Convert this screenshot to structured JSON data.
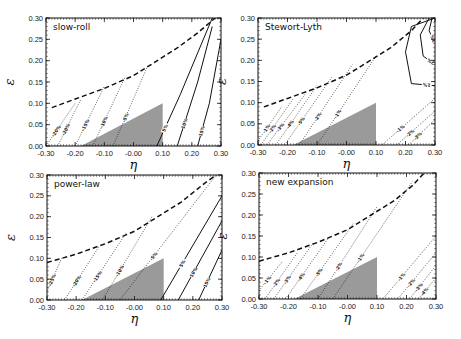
{
  "chart_data": [
    {
      "type": "line",
      "title": "slow-roll",
      "xlabel": "η",
      "ylabel": "ε",
      "xlim": [
        -0.3,
        0.3
      ],
      "ylim": [
        0.0,
        0.3
      ],
      "xticks": [
        "-0.30",
        "-0.20",
        "-0.10",
        "-0.00",
        "0.10",
        "0.20",
        "0.30"
      ],
      "yticks": [
        "0.00",
        "0.05",
        "0.10",
        "0.15",
        "0.20",
        "0.25",
        "0.30"
      ],
      "shaded_region": {
        "vertices": [
          [
            -0.18,
            0.0
          ],
          [
            0.1,
            0.0
          ],
          [
            0.1,
            0.1
          ]
        ],
        "color": "#9a9a9a"
      },
      "dashed_boundary": {
        "x": [
          -0.28,
          -0.2,
          -0.1,
          0.0,
          0.07,
          0.15,
          0.22,
          0.28
        ],
        "y": [
          0.09,
          0.11,
          0.135,
          0.165,
          0.195,
          0.23,
          0.265,
          0.3
        ]
      },
      "contours": [
        {
          "label": "-20%",
          "style": "dotted",
          "x": [
            -0.3,
            -0.2
          ],
          "y": [
            0.0,
            0.1
          ]
        },
        {
          "label": "-20%",
          "style": "dotted",
          "x": [
            -0.26,
            -0.18
          ],
          "y": [
            0.0,
            0.11
          ]
        },
        {
          "label": "-15%",
          "style": "dotted",
          "x": [
            -0.2,
            -0.1
          ],
          "y": [
            0.0,
            0.14
          ]
        },
        {
          "label": "-10%",
          "style": "dotted",
          "x": [
            -0.14,
            -0.03
          ],
          "y": [
            0.0,
            0.16
          ]
        },
        {
          "label": "-5%",
          "style": "dotted",
          "x": [
            -0.07,
            0.05
          ],
          "y": [
            0.0,
            0.19
          ]
        },
        {
          "label": "5%",
          "style": "solid",
          "x": [
            0.08,
            0.16,
            0.27
          ],
          "y": [
            0.0,
            0.12,
            0.3
          ]
        },
        {
          "label": "10%",
          "style": "solid",
          "x": [
            0.15,
            0.22,
            0.27
          ],
          "y": [
            0.0,
            0.15,
            0.28
          ]
        },
        {
          "label": "15%",
          "style": "solid",
          "x": [
            0.22,
            0.26,
            0.3
          ],
          "y": [
            0.0,
            0.1,
            0.25
          ]
        }
      ]
    },
    {
      "type": "line",
      "title": "Stewort-Lyth",
      "xlabel": "η",
      "ylabel": "ε",
      "xlim": [
        -0.3,
        0.3
      ],
      "ylim": [
        0.0,
        0.3
      ],
      "xticks": [
        "-0.30",
        "-0.20",
        "-0.10",
        "-0.00",
        "0.10",
        "0.20",
        "0.30"
      ],
      "yticks": [
        "0.00",
        "0.05",
        "0.10",
        "0.15",
        "0.20",
        "0.25",
        "0.30"
      ],
      "shaded_region": {
        "vertices": [
          [
            -0.18,
            0.0
          ],
          [
            0.1,
            0.0
          ],
          [
            0.1,
            0.1
          ]
        ],
        "color": "#9a9a9a"
      },
      "dashed_boundary": {
        "x": [
          -0.28,
          -0.2,
          -0.1,
          0.0,
          0.07,
          0.15,
          0.22,
          0.26
        ],
        "y": [
          0.09,
          0.11,
          0.135,
          0.165,
          0.195,
          0.23,
          0.27,
          0.3
        ]
      },
      "contours": [
        {
          "label": "-1%",
          "style": "dotted",
          "x": [
            -0.3,
            -0.22
          ],
          "y": [
            0.01,
            0.09
          ]
        },
        {
          "label": "-2%",
          "style": "dotted",
          "x": [
            -0.29,
            -0.18
          ],
          "y": [
            0.0,
            0.11
          ]
        },
        {
          "label": "-3%",
          "style": "dotted",
          "x": [
            -0.27,
            -0.14
          ],
          "y": [
            0.0,
            0.12
          ]
        },
        {
          "label": "-4%",
          "style": "dotted",
          "x": [
            -0.24,
            -0.1
          ],
          "y": [
            0.0,
            0.14
          ]
        },
        {
          "label": "-5%",
          "style": "dotted",
          "x": [
            -0.21,
            -0.05
          ],
          "y": [
            0.0,
            0.16
          ]
        },
        {
          "label": "-2%",
          "style": "dotted",
          "x": [
            -0.16,
            0.02
          ],
          "y": [
            0.0,
            0.19
          ]
        },
        {
          "label": "-1%",
          "style": "dotted",
          "x": [
            -0.1,
            0.1
          ],
          "y": [
            0.0,
            0.21
          ]
        },
        {
          "label": "1%",
          "style": "solid",
          "x": [
            0.3,
            0.22,
            0.2,
            0.22,
            0.3
          ],
          "y": [
            0.14,
            0.145,
            0.22,
            0.28,
            0.3
          ]
        },
        {
          "label": "2%",
          "style": "solid",
          "x": [
            0.3,
            0.26,
            0.25,
            0.28
          ],
          "y": [
            0.19,
            0.21,
            0.26,
            0.3
          ]
        },
        {
          "label": "3%",
          "style": "solid",
          "x": [
            0.3,
            0.28,
            0.29
          ],
          "y": [
            0.24,
            0.27,
            0.3
          ]
        },
        {
          "label": "-1%",
          "style": "dotted",
          "x": [
            0.12,
            0.3
          ],
          "y": [
            0.0,
            0.11
          ]
        },
        {
          "label": "-2%",
          "style": "dotted",
          "x": [
            0.17,
            0.3
          ],
          "y": [
            0.0,
            0.08
          ]
        },
        {
          "label": "-3%",
          "style": "dotted",
          "x": [
            0.21,
            0.3
          ],
          "y": [
            0.0,
            0.06
          ]
        }
      ]
    },
    {
      "type": "line",
      "title": "power-law",
      "xlabel": "η",
      "ylabel": "ε",
      "xlim": [
        -0.3,
        0.3
      ],
      "ylim": [
        0.0,
        0.3
      ],
      "xticks": [
        "-0.30",
        "-0.20",
        "-0.10",
        "-0.00",
        "0.10",
        "0.20",
        "0.30"
      ],
      "yticks": [
        "0.00",
        "0.05",
        "0.10",
        "0.15",
        "0.20",
        "0.25",
        "0.30"
      ],
      "shaded_region": {
        "vertices": [
          [
            -0.18,
            0.0
          ],
          [
            0.1,
            0.0
          ],
          [
            0.1,
            0.1
          ]
        ],
        "color": "#9a9a9a"
      },
      "dashed_boundary": {
        "x": [
          -0.3,
          -0.2,
          -0.1,
          0.0,
          0.08,
          0.16,
          0.24,
          0.28
        ],
        "y": [
          0.09,
          0.11,
          0.135,
          0.165,
          0.2,
          0.235,
          0.28,
          0.3
        ]
      },
      "contours": [
        {
          "label": "-25%",
          "style": "dotted",
          "x": [
            -0.3,
            -0.25
          ],
          "y": [
            0.02,
            0.1
          ]
        },
        {
          "label": "-20%",
          "style": "dotted",
          "x": [
            -0.24,
            -0.12
          ],
          "y": [
            0.0,
            0.13
          ]
        },
        {
          "label": "-15%",
          "style": "dotted",
          "x": [
            -0.18,
            -0.03
          ],
          "y": [
            0.0,
            0.16
          ]
        },
        {
          "label": "-10%",
          "style": "dotted",
          "x": [
            -0.11,
            0.06
          ],
          "y": [
            0.0,
            0.2
          ]
        },
        {
          "label": "-5%",
          "style": "dotted",
          "x": [
            -0.05,
            0.28
          ],
          "y": [
            0.0,
            0.3
          ]
        },
        {
          "label": "5%",
          "style": "solid",
          "x": [
            0.09,
            0.3
          ],
          "y": [
            0.0,
            0.25
          ]
        },
        {
          "label": "10%",
          "style": "solid",
          "x": [
            0.15,
            0.3
          ],
          "y": [
            0.0,
            0.19
          ]
        },
        {
          "label": "15%",
          "style": "solid",
          "x": [
            0.22,
            0.3
          ],
          "y": [
            0.0,
            0.12
          ]
        }
      ]
    },
    {
      "type": "line",
      "title": "new expansion",
      "xlabel": "η",
      "ylabel": "ε",
      "xlim": [
        -0.3,
        0.3
      ],
      "ylim": [
        0.0,
        0.3
      ],
      "xticks": [
        "-0.30",
        "-0.20",
        "-0.10",
        "-0.00",
        "0.10",
        "0.20",
        "0.30"
      ],
      "yticks": [
        "0.00",
        "0.05",
        "0.10",
        "0.15",
        "0.20",
        "0.25",
        "0.30"
      ],
      "shaded_region": {
        "vertices": [
          [
            -0.18,
            0.0
          ],
          [
            0.1,
            0.0
          ],
          [
            0.1,
            0.1
          ]
        ],
        "color": "#9a9a9a"
      },
      "dashed_boundary": {
        "x": [
          -0.3,
          -0.2,
          -0.1,
          0.0,
          0.08,
          0.16,
          0.22,
          0.26
        ],
        "y": [
          0.09,
          0.11,
          0.135,
          0.165,
          0.2,
          0.235,
          0.27,
          0.3
        ]
      },
      "contours": [
        {
          "label": "-1%",
          "style": "dotted",
          "x": [
            -0.3,
            -0.22
          ],
          "y": [
            0.02,
            0.09
          ]
        },
        {
          "label": "-2%",
          "style": "dotted",
          "x": [
            -0.28,
            -0.17
          ],
          "y": [
            0.0,
            0.11
          ]
        },
        {
          "label": "-3%",
          "style": "dotted",
          "x": [
            -0.25,
            -0.12
          ],
          "y": [
            0.0,
            0.13
          ]
        },
        {
          "label": "-4%",
          "style": "dotted",
          "x": [
            -0.21,
            -0.06
          ],
          "y": [
            0.0,
            0.15
          ]
        },
        {
          "label": "-5%",
          "style": "dotted",
          "x": [
            -0.16,
            0.02
          ],
          "y": [
            0.0,
            0.18
          ]
        },
        {
          "label": "-2%",
          "style": "dotted",
          "x": [
            -0.1,
            0.1
          ],
          "y": [
            0.0,
            0.22
          ]
        },
        {
          "label": "-1%",
          "style": "dotted",
          "x": [
            -0.05,
            0.22
          ],
          "y": [
            0.0,
            0.28
          ]
        },
        {
          "label": "-1%",
          "style": "dotted",
          "x": [
            0.12,
            0.3
          ],
          "y": [
            0.0,
            0.15
          ]
        },
        {
          "label": "-2%",
          "style": "dotted",
          "x": [
            0.17,
            0.3
          ],
          "y": [
            0.0,
            0.11
          ]
        },
        {
          "label": "-3%",
          "style": "dotted",
          "x": [
            0.21,
            0.3
          ],
          "y": [
            0.0,
            0.08
          ]
        },
        {
          "label": "-4%",
          "style": "dotted",
          "x": [
            0.24,
            0.3
          ],
          "y": [
            0.0,
            0.05
          ]
        }
      ]
    }
  ],
  "layout": {
    "panels": [
      {
        "x0": 46,
        "x1": 221,
        "y0": 18,
        "y1": 146
      },
      {
        "x0": 258,
        "x1": 435,
        "y0": 18,
        "y1": 145
      },
      {
        "x0": 47,
        "x1": 222,
        "y0": 175,
        "y1": 300
      },
      {
        "x0": 259,
        "x1": 436,
        "y0": 173,
        "y1": 299
      }
    ]
  }
}
